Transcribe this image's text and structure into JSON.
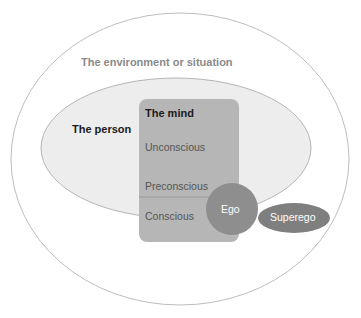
{
  "diagram": {
    "type": "nested-model",
    "environment": {
      "label": "The environment or situation"
    },
    "person": {
      "label": "The person"
    },
    "mind": {
      "title": "The mind",
      "layers": [
        {
          "label": "Unconscious"
        },
        {
          "label": "Preconscious"
        },
        {
          "label": "Conscious"
        }
      ]
    },
    "ego": {
      "label": "Ego"
    },
    "superego": {
      "label": "Superego"
    }
  },
  "colors": {
    "outer_stroke": "#bdbdbd",
    "person_fill": "#ededed",
    "person_stroke": "#b5b5b5",
    "mind_fill": "#b6b6b6",
    "ego_fill": "#8e8e8e",
    "superego_fill": "#7f7f7f"
  }
}
